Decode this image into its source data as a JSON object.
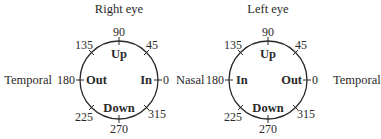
{
  "diagrams": [
    {
      "title": "Right eye",
      "left_side": "Temporal",
      "right_side": "Nasal",
      "directions": {
        "up": "Up",
        "down": "Down",
        "left": "Out",
        "right": "In"
      },
      "angles": {
        "a0": "0",
        "a45": "45",
        "a90": "90",
        "a135": "135",
        "a180": "180",
        "a225": "225",
        "a270": "270",
        "a315": "315"
      }
    },
    {
      "title": "Left eye",
      "left_side": "Nasal",
      "right_side": "Temporal",
      "directions": {
        "up": "Up",
        "down": "Down",
        "left": "In",
        "right": "Out"
      },
      "angles": {
        "a0": "0",
        "a45": "45",
        "a90": "90",
        "a135": "135",
        "a180": "180",
        "a225": "225",
        "a270": "270",
        "a315": "315"
      }
    }
  ]
}
